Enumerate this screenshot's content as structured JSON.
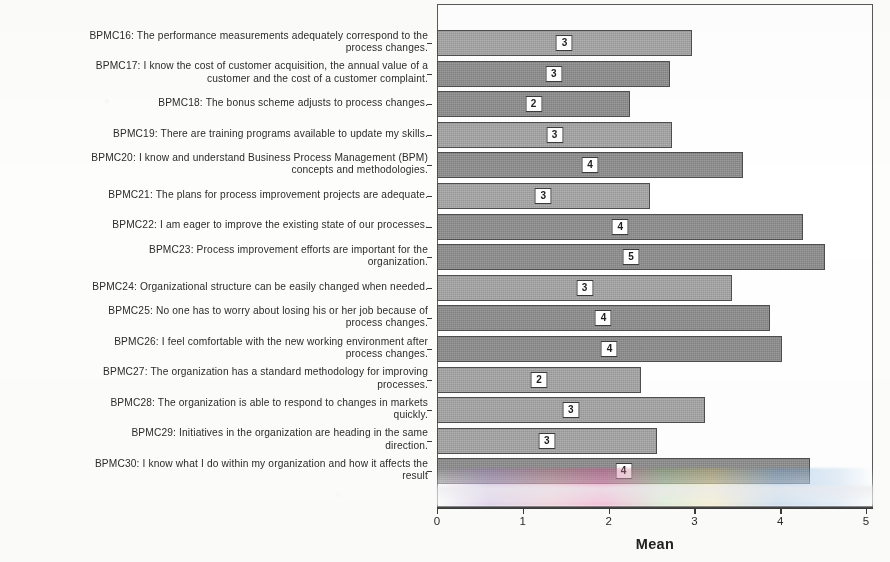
{
  "chart_data": {
    "type": "bar",
    "orientation": "horizontal",
    "title": "",
    "xlabel": "Mean",
    "ylabel": "",
    "xlim": [
      0,
      5
    ],
    "xticks": [
      "0",
      "1",
      "2",
      "3",
      "4",
      "5"
    ],
    "grid": false,
    "legend": null,
    "bar_color": "#9d9d9d",
    "categories": [
      "BPMC16: The performance measurements adequately correspond to the\nprocess changes.",
      "BPMC17: I know the cost of customer acquisition, the annual value of a\ncustomer and the cost of a customer complaint.",
      "BPMC18: The bonus scheme adjusts to process changes.",
      "BPMC19: There are training programs available to update my skills.",
      "BPMC20: I know and understand Business Process Management (BPM)\nconcepts and methodologies.",
      "BPMC21: The plans for process improvement projects are adequate.",
      "BPMC22: I am eager to improve the existing state of our processes.",
      "BPMC23: Process improvement efforts are important for the\norganization.",
      "BPMC24: Organizational structure can be easily changed when needed.",
      "BPMC25: No one has to worry about losing his or her job because of\nprocess changes.",
      "BPMC26: I feel comfortable with the new working environment after\nprocess changes.",
      "BPMC27: The organization has a standard methodology for improving\nprocesses.",
      "BPMC28: The organization is able to respond to changes in markets\nquickly.",
      "BPMC29: Initiatives in the organization are heading in the same\ndirection.",
      "BPMC30: I know what I do within my organization and how it affects the\nresult"
    ],
    "values": [
      2.97,
      2.72,
      2.25,
      2.74,
      3.57,
      2.48,
      4.27,
      4.52,
      3.44,
      3.88,
      4.02,
      2.38,
      3.12,
      2.56,
      4.35
    ],
    "data_labels": [
      "3",
      "3",
      "2",
      "3",
      "4",
      "3",
      "4",
      "5",
      "3",
      "4",
      "4",
      "2",
      "3",
      "3",
      "4"
    ]
  }
}
